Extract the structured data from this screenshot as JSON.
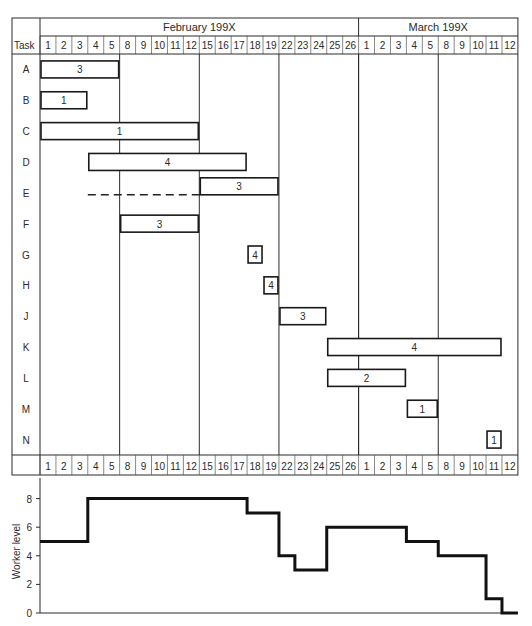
{
  "header": {
    "task_label": "Task",
    "months": [
      {
        "label": "February 199X",
        "start_col": 0,
        "span": 20
      },
      {
        "label": "March 199X",
        "start_col": 20,
        "span": 10
      }
    ],
    "days": [
      "1",
      "2",
      "3",
      "4",
      "5",
      "8",
      "9",
      "10",
      "11",
      "12",
      "15",
      "16",
      "17",
      "18",
      "19",
      "22",
      "23",
      "24",
      "25",
      "26",
      "1",
      "2",
      "3",
      "4",
      "5",
      "8",
      "9",
      "10",
      "11",
      "12"
    ]
  },
  "week_separators_after_col": [
    4,
    9,
    14,
    19,
    24
  ],
  "tasks": [
    {
      "id": "A",
      "start": 0,
      "end": 4,
      "workers": "3"
    },
    {
      "id": "B",
      "start": 0,
      "end": 2,
      "workers": "1"
    },
    {
      "id": "C",
      "start": 0,
      "end": 9,
      "workers": "1"
    },
    {
      "id": "D",
      "start": 3,
      "end": 12,
      "workers": "4"
    },
    {
      "id": "E",
      "start": 10,
      "end": 14,
      "workers": "3",
      "float_from": 3
    },
    {
      "id": "F",
      "start": 5,
      "end": 9,
      "workers": "3"
    },
    {
      "id": "G",
      "start": 13,
      "end": 13,
      "workers": "4"
    },
    {
      "id": "H",
      "start": 14,
      "end": 14,
      "workers": "4"
    },
    {
      "id": "J",
      "start": 15,
      "end": 17,
      "workers": "3"
    },
    {
      "id": "K",
      "start": 18,
      "end": 28,
      "workers": "4"
    },
    {
      "id": "L",
      "start": 18,
      "end": 22,
      "workers": "2"
    },
    {
      "id": "M",
      "start": 23,
      "end": 24,
      "workers": "1"
    },
    {
      "id": "N",
      "start": 28,
      "end": 28,
      "workers": "1"
    }
  ],
  "histogram": {
    "ylabel": "Worker level",
    "yticks": [
      "0",
      "2",
      "4",
      "6",
      "8"
    ]
  },
  "chart_data": [
    {
      "type": "gantt",
      "title": "",
      "xlabel": "",
      "ylabel": "Task",
      "categories": [
        "A",
        "B",
        "C",
        "D",
        "E",
        "F",
        "G",
        "H",
        "J",
        "K",
        "L",
        "M",
        "N"
      ],
      "x_ticks": [
        "Feb 1",
        "Feb 2",
        "Feb 3",
        "Feb 4",
        "Feb 5",
        "Feb 8",
        "Feb 9",
        "Feb 10",
        "Feb 11",
        "Feb 12",
        "Feb 15",
        "Feb 16",
        "Feb 17",
        "Feb 18",
        "Feb 19",
        "Feb 22",
        "Feb 23",
        "Feb 24",
        "Feb 25",
        "Feb 26",
        "Mar 1",
        "Mar 2",
        "Mar 3",
        "Mar 4",
        "Mar 5",
        "Mar 8",
        "Mar 9",
        "Mar 10",
        "Mar 11",
        "Mar 12"
      ],
      "bars": [
        {
          "task": "A",
          "start": "Feb 1",
          "end": "Feb 5",
          "workers": 3
        },
        {
          "task": "B",
          "start": "Feb 1",
          "end": "Feb 3",
          "workers": 1
        },
        {
          "task": "C",
          "start": "Feb 1",
          "end": "Feb 12",
          "workers": 1
        },
        {
          "task": "D",
          "start": "Feb 4",
          "end": "Feb 17",
          "workers": 4
        },
        {
          "task": "E",
          "start": "Feb 15",
          "end": "Feb 19",
          "workers": 3,
          "float_start": "Feb 4"
        },
        {
          "task": "F",
          "start": "Feb 8",
          "end": "Feb 12",
          "workers": 3
        },
        {
          "task": "G",
          "start": "Feb 18",
          "end": "Feb 18",
          "workers": 4
        },
        {
          "task": "H",
          "start": "Feb 19",
          "end": "Feb 19",
          "workers": 4
        },
        {
          "task": "J",
          "start": "Feb 22",
          "end": "Feb 24",
          "workers": 3
        },
        {
          "task": "K",
          "start": "Feb 25",
          "end": "Mar 10",
          "workers": 4
        },
        {
          "task": "L",
          "start": "Feb 25",
          "end": "Mar 3",
          "workers": 2
        },
        {
          "task": "M",
          "start": "Mar 4",
          "end": "Mar 5",
          "workers": 1
        },
        {
          "task": "N",
          "start": "Mar 11",
          "end": "Mar 11",
          "workers": 1
        }
      ]
    },
    {
      "type": "line",
      "style": "step",
      "title": "",
      "xlabel": "",
      "ylabel": "Worker level",
      "ylim": [
        0,
        8
      ],
      "yticks": [
        0,
        2,
        4,
        6,
        8
      ],
      "x": [
        "Feb 1",
        "Feb 2",
        "Feb 3",
        "Feb 4",
        "Feb 5",
        "Feb 8",
        "Feb 9",
        "Feb 10",
        "Feb 11",
        "Feb 12",
        "Feb 15",
        "Feb 16",
        "Feb 17",
        "Feb 18",
        "Feb 19",
        "Feb 22",
        "Feb 23",
        "Feb 24",
        "Feb 25",
        "Feb 26",
        "Mar 1",
        "Mar 2",
        "Mar 3",
        "Mar 4",
        "Mar 5",
        "Mar 8",
        "Mar 9",
        "Mar 10",
        "Mar 11",
        "Mar 12"
      ],
      "series": [
        {
          "name": "Worker level",
          "values": [
            5,
            5,
            5,
            8,
            8,
            8,
            8,
            8,
            8,
            8,
            8,
            8,
            8,
            7,
            7,
            4,
            3,
            3,
            6,
            6,
            6,
            6,
            6,
            5,
            5,
            4,
            4,
            4,
            1,
            0
          ]
        }
      ]
    }
  ]
}
